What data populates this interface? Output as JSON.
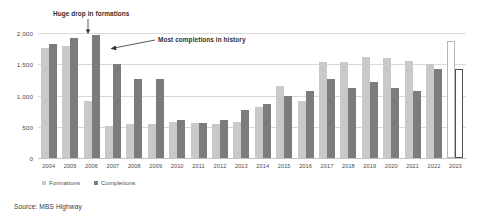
{
  "chart_data": {
    "type": "bar",
    "title": "",
    "subtitle": "",
    "xlabel": "",
    "ylabel": "",
    "ylim": [
      0,
      2000
    ],
    "yticks": [
      0,
      500,
      1000,
      1500,
      2000
    ],
    "ytick_labels": [
      "0",
      "500",
      "1,000",
      "1,500",
      "2,000"
    ],
    "grid": true,
    "legend_position": "bottom-left",
    "categories": [
      "2004",
      "2005",
      "2006",
      "2007",
      "2008",
      "2009",
      "2010",
      "2011",
      "2012",
      "2013",
      "2014",
      "2015",
      "2016",
      "2017",
      "2018",
      "2019",
      "2020",
      "2021",
      "2022",
      "2023"
    ],
    "series": [
      {
        "name": "Formations",
        "color": "#c9c9c9",
        "values": [
          1760,
          1800,
          920,
          510,
          540,
          545,
          570,
          560,
          540,
          570,
          810,
          1160,
          920,
          1530,
          1530,
          1610,
          1605,
          1560,
          1505,
          1880
        ]
      },
      {
        "name": "Completions",
        "color": "#7c7c7c",
        "values": [
          1820,
          1920,
          1965,
          1505,
          1265,
          1265,
          610,
          560,
          610,
          765,
          870,
          990,
          1070,
          1265,
          1115,
          1215,
          1115,
          1070,
          1425,
          1425
        ]
      }
    ],
    "forecast_category": "2023",
    "annotations": [
      {
        "id": "drop",
        "text": "Huge drop in formations",
        "points_to": "2006"
      },
      {
        "id": "completions",
        "text": "Most completions in history",
        "points_to": "2006"
      }
    ]
  },
  "legend": {
    "items": [
      {
        "label": "Formations",
        "color": "#c9c9c9"
      },
      {
        "label": "Completions",
        "color": "#7c7c7c"
      }
    ]
  },
  "source": {
    "text": "Source: MBS Highway"
  },
  "colors": {
    "formations": "#c9c9c9",
    "completions": "#7c7c7c",
    "gridline": "#d9d9d9",
    "text": "#3a3a3a",
    "forecast_outline": "#4f4f4f"
  }
}
